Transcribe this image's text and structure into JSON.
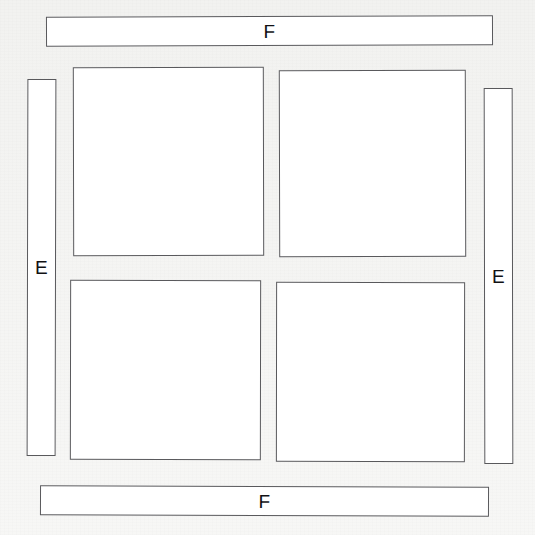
{
  "diagram": {
    "background_color": "#f3f3f1",
    "stroke_color": "#59595c",
    "fill_color": "#ffffff",
    "label_color": "#111114",
    "strips": [
      {
        "id": "strip-top",
        "label": "F",
        "orientation": "horizontal",
        "position": "top",
        "x": 46,
        "y": 16,
        "width": 447,
        "height": 30
      },
      {
        "id": "strip-bottom",
        "label": "F",
        "orientation": "horizontal",
        "position": "bottom",
        "x": 40,
        "y": 486,
        "width": 449,
        "height": 30
      },
      {
        "id": "strip-left",
        "label": "E",
        "orientation": "vertical",
        "position": "left",
        "x": 27,
        "y": 79,
        "width": 29,
        "height": 377
      },
      {
        "id": "strip-right",
        "label": "E",
        "orientation": "vertical",
        "position": "right",
        "x": 484,
        "y": 88,
        "width": 29,
        "height": 376
      }
    ],
    "panels": [
      {
        "id": "panel-top-left",
        "label": "",
        "position": "top-left",
        "x": 73,
        "y": 67,
        "width": 191,
        "height": 189
      },
      {
        "id": "panel-top-right",
        "label": "",
        "position": "top-right",
        "x": 279,
        "y": 70,
        "width": 187,
        "height": 187
      },
      {
        "id": "panel-bottom-left",
        "label": "",
        "position": "bottom-left",
        "x": 70,
        "y": 280,
        "width": 191,
        "height": 180
      },
      {
        "id": "panel-bottom-right",
        "label": "",
        "position": "bottom-right",
        "x": 276,
        "y": 282,
        "width": 189,
        "height": 180
      }
    ]
  }
}
